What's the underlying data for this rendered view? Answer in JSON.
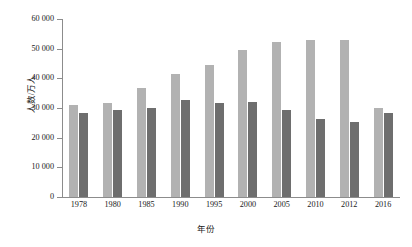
{
  "chart_data": {
    "type": "bar",
    "title": "",
    "xlabel": "年份",
    "ylabel": "人数/万人",
    "categories": [
      "1978",
      "1980",
      "1985",
      "1990",
      "1995",
      "2000",
      "2005",
      "2010",
      "2012",
      "2016"
    ],
    "ytick_labels": [
      "60 000",
      "50 000",
      "40 000",
      "30 000",
      "20 000",
      "10 000",
      "0"
    ],
    "ytick_values": [
      60000,
      50000,
      40000,
      30000,
      20000,
      10000,
      0
    ],
    "ylim": [
      0,
      60000
    ],
    "grid": false,
    "legend": "none",
    "series": [
      {
        "name": "series-a",
        "color": "#b2b2b2",
        "values": [
          30900,
          31800,
          36700,
          41600,
          44500,
          49700,
          52300,
          52800,
          53000,
          30100
        ]
      },
      {
        "name": "series-b",
        "color": "#6e6e6e",
        "values": [
          28300,
          29400,
          29900,
          32800,
          31700,
          32000,
          29400,
          26400,
          25300,
          28400
        ]
      }
    ]
  },
  "caption": ""
}
